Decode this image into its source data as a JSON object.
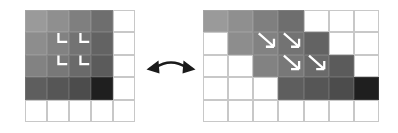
{
  "figure": {
    "background_color": "#ffffff",
    "width": 398,
    "height": 133
  },
  "palette": {
    "empty_cell": "#ffffff",
    "grid_line": "#c8c8c8",
    "mark_color": "#ffffff",
    "arrow_color": "#1a1a1a",
    "shades": [
      "#9a9a9a",
      "#8f8f8f",
      "#838383",
      "#737373",
      "#6a6a6a",
      "#636363",
      "#5b5b5b",
      "#545454",
      "#4d4d4d",
      "#444444",
      "#3a3a3a",
      "#2b2b2b",
      "#1a1a1a"
    ]
  },
  "left_panel": {
    "name": "original-grid",
    "columns": 5,
    "rows": 5,
    "cell_colors": [
      [
        "#9a9a9a",
        "#8f8f8f",
        "#7f7f7f",
        "#6e6e6e",
        "#ffffff"
      ],
      [
        "#8d8d8d",
        "#828282",
        "#737373",
        "#636363",
        "#ffffff"
      ],
      [
        "#828282",
        "#787878",
        "#6a6a6a",
        "#5b5b5b",
        "#ffffff"
      ],
      [
        "#5e5e5e",
        "#565656",
        "#4c4c4c",
        "#1f1f1f",
        "#ffffff"
      ],
      [
        "#ffffff",
        "#ffffff",
        "#ffffff",
        "#ffffff",
        "#ffffff"
      ]
    ],
    "marks": {
      "type": "corner-l-mark",
      "count": 4,
      "color": "#ffffff",
      "positions": [
        {
          "col": 2,
          "row": 2
        },
        {
          "col": 3,
          "row": 2
        },
        {
          "col": 2,
          "row": 3
        },
        {
          "col": 3,
          "row": 3
        }
      ]
    }
  },
  "right_panel": {
    "name": "sheared-grid",
    "columns": 7,
    "rows": 5,
    "cell_colors": [
      [
        "#9a9a9a",
        "#8f8f8f",
        "#7f7f7f",
        "#6e6e6e",
        "#ffffff",
        "#ffffff",
        "#ffffff"
      ],
      [
        "#ffffff",
        "#8d8d8d",
        "#828282",
        "#737373",
        "#636363",
        "#ffffff",
        "#ffffff"
      ],
      [
        "#ffffff",
        "#ffffff",
        "#828282",
        "#787878",
        "#6a6a6a",
        "#5b5b5b",
        "#ffffff"
      ],
      [
        "#ffffff",
        "#ffffff",
        "#ffffff",
        "#5e5e5e",
        "#565656",
        "#4c4c4c",
        "#1f1f1f"
      ],
      [
        "#ffffff",
        "#ffffff",
        "#ffffff",
        "#ffffff",
        "#ffffff",
        "#ffffff",
        "#ffffff"
      ]
    ],
    "marks": {
      "type": "diagonal-arrow-mark",
      "count": 4,
      "color": "#ffffff",
      "direction": "down-right",
      "positions": [
        {
          "col": 3,
          "row": 2
        },
        {
          "col": 4,
          "row": 2
        },
        {
          "col": 4,
          "row": 3
        },
        {
          "col": 5,
          "row": 3
        }
      ]
    }
  },
  "connector": {
    "name": "double-headed-curved-arrow",
    "color": "#1a1a1a",
    "heads": [
      "left",
      "right"
    ],
    "curve": "arc-up"
  }
}
